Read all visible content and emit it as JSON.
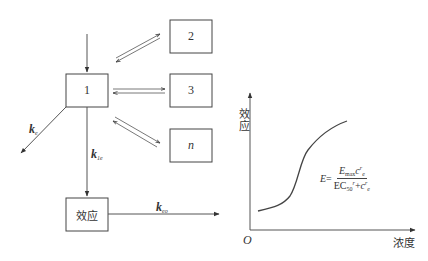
{
  "diagram": {
    "compartments": [
      {
        "id": "1",
        "label": "1"
      },
      {
        "id": "2",
        "label": "2"
      },
      {
        "id": "3",
        "label": "3"
      },
      {
        "id": "n",
        "label": "n"
      }
    ],
    "effect_box": {
      "label": "效应"
    },
    "rate_constants": {
      "k_e": {
        "symbol": "k",
        "sub": "e"
      },
      "k_1e": {
        "symbol": "k",
        "sub": "1e"
      },
      "k_eo": {
        "symbol": "k",
        "sub": "eo"
      }
    },
    "graph": {
      "y_axis_label": "效应",
      "x_axis_label": "浓度",
      "origin_label": "O",
      "equation": {
        "lhs": "E",
        "equals": "=",
        "numerator": {
          "E": "E",
          "E_sub": "max",
          "c": "c",
          "c_sup": "r",
          "c_sub": "e"
        },
        "denominator": {
          "EC": "EC",
          "EC_sub": "50",
          "EC_sup": "r",
          "plus": "+",
          "c": "c",
          "c_sup": "r",
          "c_sub": "e"
        }
      }
    }
  }
}
